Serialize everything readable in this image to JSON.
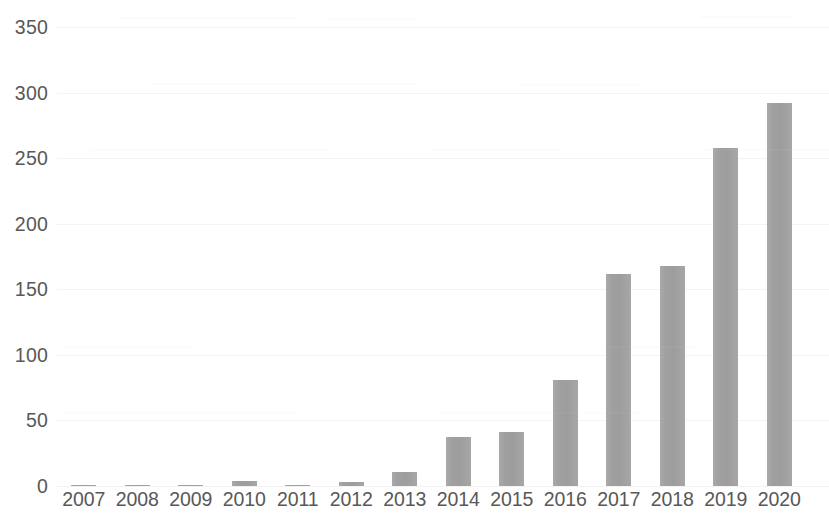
{
  "chart_data": {
    "type": "bar",
    "title": "",
    "subtitle": "",
    "xlabel": "",
    "ylabel": "",
    "categories": [
      "2007",
      "2008",
      "2009",
      "2010",
      "2011",
      "2012",
      "2013",
      "2014",
      "2015",
      "2016",
      "2017",
      "2018",
      "2019",
      "2020"
    ],
    "values": [
      1,
      1,
      1,
      4,
      1,
      3,
      11,
      37,
      41,
      81,
      162,
      168,
      258,
      292
    ],
    "series": [
      {
        "name": "",
        "values": [
          1,
          1,
          1,
          4,
          1,
          3,
          11,
          37,
          41,
          81,
          162,
          168,
          258,
          292
        ]
      }
    ],
    "ylim": [
      0,
      350
    ],
    "y_ticks": [
      0,
      50,
      100,
      150,
      200,
      250,
      300,
      350
    ],
    "y_tick_labels": [
      "0",
      "50",
      "100",
      "150",
      "200",
      "250",
      "300",
      "350"
    ],
    "x_tick_labels": [
      "2007",
      "2008",
      "2009",
      "2010",
      "2011",
      "2012",
      "2013",
      "2014",
      "2015",
      "2016",
      "2017",
      "2018",
      "2019",
      "2020"
    ],
    "grid": true,
    "grid_axis": "y",
    "legend": false,
    "legend_position": "none",
    "annotations": [],
    "colors": {
      "bar": "#a0a0a0",
      "gridline": "#f1f1f1",
      "tick_label": "#585858",
      "background": "#ffffff"
    }
  }
}
